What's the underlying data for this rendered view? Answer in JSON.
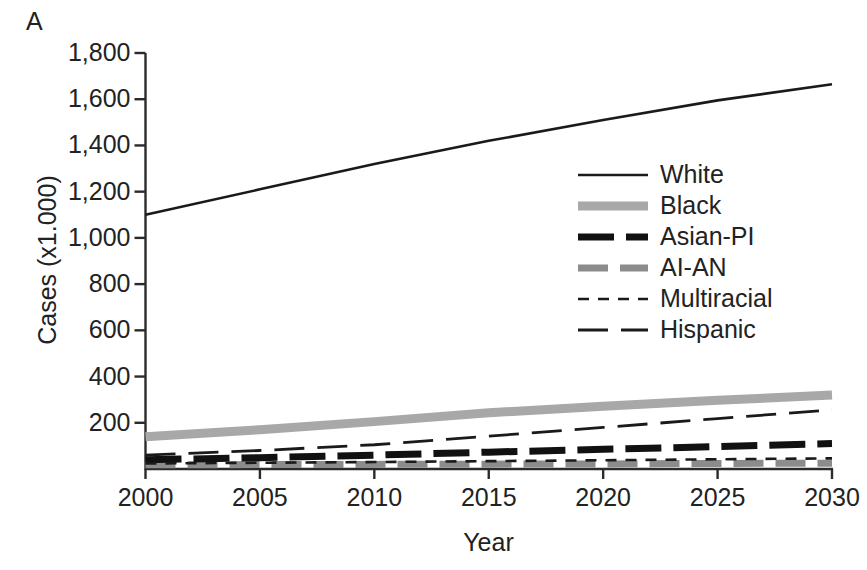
{
  "figure": {
    "panel_label": "A"
  },
  "chart_data": {
    "type": "line",
    "title": "",
    "xlabel": "Year",
    "ylabel": "Cases (x1.000)",
    "xlim": [
      2000,
      2030
    ],
    "ylim": [
      0,
      1800
    ],
    "xticks": [
      2000,
      2005,
      2010,
      2015,
      2020,
      2025,
      2030
    ],
    "xtick_labels": [
      "2000",
      "2005",
      "2010",
      "2015",
      "2020",
      "2025",
      "2030"
    ],
    "yticks": [
      200,
      400,
      600,
      800,
      1000,
      1200,
      1400,
      1600,
      1800
    ],
    "ytick_labels": [
      "200",
      "400",
      "600",
      "800",
      "1,000",
      "1,200",
      "1,400",
      "1,600",
      "1,800"
    ],
    "grid": false,
    "legend_position": "inside-upper-right",
    "x": [
      2000,
      2005,
      2010,
      2015,
      2020,
      2025,
      2030
    ],
    "series": [
      {
        "name": "White",
        "style": "solid-thin-black",
        "color": "#1a1a1a",
        "width": 2.6,
        "dash": "none",
        "values": [
          1100,
          1210,
          1320,
          1420,
          1510,
          1595,
          1665
        ]
      },
      {
        "name": "Black",
        "style": "solid-thick-lightgray",
        "color": "#a8a8a8",
        "width": 9,
        "dash": "none",
        "values": [
          140,
          170,
          205,
          243,
          272,
          297,
          320
        ]
      },
      {
        "name": "Asian-PI",
        "style": "dashed-thick-black",
        "color": "#111111",
        "width": 7,
        "dash": "36 12",
        "values": [
          40,
          49,
          60,
          73,
          85,
          97,
          110
        ]
      },
      {
        "name": "AI-AN",
        "style": "dashed-thick-gray",
        "color": "#8c8c8c",
        "width": 7,
        "dash": "30 12",
        "values": [
          18,
          19,
          20,
          21,
          22,
          24,
          25
        ]
      },
      {
        "name": "Multiracial",
        "style": "dashed-fine-black",
        "color": "#1a1a1a",
        "width": 2.6,
        "dash": "11 9",
        "values": [
          24,
          27,
          30,
          34,
          38,
          42,
          46
        ]
      },
      {
        "name": "Hispanic",
        "style": "dashed-long-black",
        "color": "#1a1a1a",
        "width": 2.8,
        "dash": "30 13",
        "values": [
          60,
          80,
          105,
          142,
          180,
          218,
          256
        ]
      }
    ]
  },
  "legend": {
    "entries": [
      {
        "label": "White"
      },
      {
        "label": "Black"
      },
      {
        "label": "Asian-PI"
      },
      {
        "label": "AI-AN"
      },
      {
        "label": "Multiracial"
      },
      {
        "label": "Hispanic"
      }
    ]
  }
}
